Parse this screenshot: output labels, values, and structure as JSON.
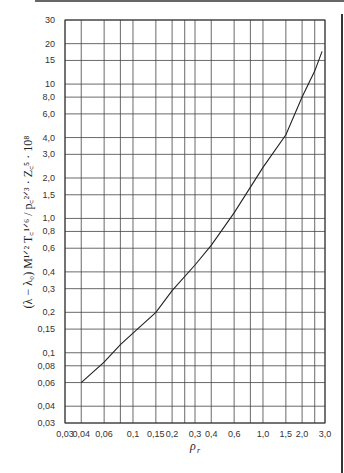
{
  "chart_data": {
    "type": "line",
    "title": "",
    "xlabel": "ρ_r",
    "ylabel": "(λ − λ0) M^(1/2) T_c^(1/6) / p_c^(2/3) · Z_c^5 · 10^8",
    "xscale": "log",
    "yscale": "log",
    "xlim": [
      0.03,
      3.0
    ],
    "ylim": [
      0.03,
      30
    ],
    "grid": true,
    "legend": null,
    "x_ticks": [
      {
        "value": 0.03,
        "label": "0,03"
      },
      {
        "value": 0.04,
        "label": "0,04"
      },
      {
        "value": 0.06,
        "label": "0,06"
      },
      {
        "value": 0.1,
        "label": "0,1"
      },
      {
        "value": 0.15,
        "label": "0,15"
      },
      {
        "value": 0.2,
        "label": "0,2"
      },
      {
        "value": 0.3,
        "label": "0,3"
      },
      {
        "value": 0.4,
        "label": "0,4"
      },
      {
        "value": 0.6,
        "label": "0,6"
      },
      {
        "value": 1.0,
        "label": "1,0"
      },
      {
        "value": 1.5,
        "label": "1,5"
      },
      {
        "value": 2.0,
        "label": "2,0"
      },
      {
        "value": 3.0,
        "label": "3,0"
      }
    ],
    "x_grid": [
      0.03,
      0.04,
      0.06,
      0.08,
      0.1,
      0.15,
      0.2,
      0.25,
      0.3,
      0.4,
      0.6,
      0.8,
      1.0,
      1.5,
      2.0,
      2.5,
      3.0
    ],
    "y_ticks": [
      {
        "value": 30,
        "label": "30"
      },
      {
        "value": 20,
        "label": "20"
      },
      {
        "value": 15,
        "label": "15"
      },
      {
        "value": 10,
        "label": "10"
      },
      {
        "value": 8,
        "label": "8,0"
      },
      {
        "value": 6,
        "label": "6,0"
      },
      {
        "value": 4,
        "label": "4,0"
      },
      {
        "value": 3,
        "label": "3,0"
      },
      {
        "value": 2,
        "label": "2,0"
      },
      {
        "value": 1.5,
        "label": "1,5"
      },
      {
        "value": 1.0,
        "label": "1,0"
      },
      {
        "value": 0.8,
        "label": "0,8"
      },
      {
        "value": 0.6,
        "label": "0,6"
      },
      {
        "value": 0.4,
        "label": "0,4"
      },
      {
        "value": 0.3,
        "label": "0,3"
      },
      {
        "value": 0.2,
        "label": "0,2"
      },
      {
        "value": 0.15,
        "label": "0,15"
      },
      {
        "value": 0.1,
        "label": "0,1"
      },
      {
        "value": 0.08,
        "label": "0,08"
      },
      {
        "value": 0.06,
        "label": "0,06"
      },
      {
        "value": 0.04,
        "label": "0,04"
      },
      {
        "value": 0.03,
        "label": "0,03"
      }
    ],
    "series": [
      {
        "name": "curve",
        "x": [
          0.04,
          0.06,
          0.08,
          0.1,
          0.15,
          0.2,
          0.3,
          0.4,
          0.6,
          1.0,
          1.5,
          2.0,
          2.5,
          2.85
        ],
        "y": [
          0.06,
          0.085,
          0.115,
          0.14,
          0.2,
          0.29,
          0.45,
          0.63,
          1.1,
          2.4,
          4.2,
          8.0,
          12.5,
          17.5
        ]
      }
    ]
  },
  "labels": {
    "xlabel_main": "ρ",
    "xlabel_sub": "r",
    "ylabel_text": "(λ − λ₀) M¹ᐟ² T꜀¹ᐟ⁶ / p꜀²ᐟ³ · Z꜀⁵ · 10⁸"
  }
}
